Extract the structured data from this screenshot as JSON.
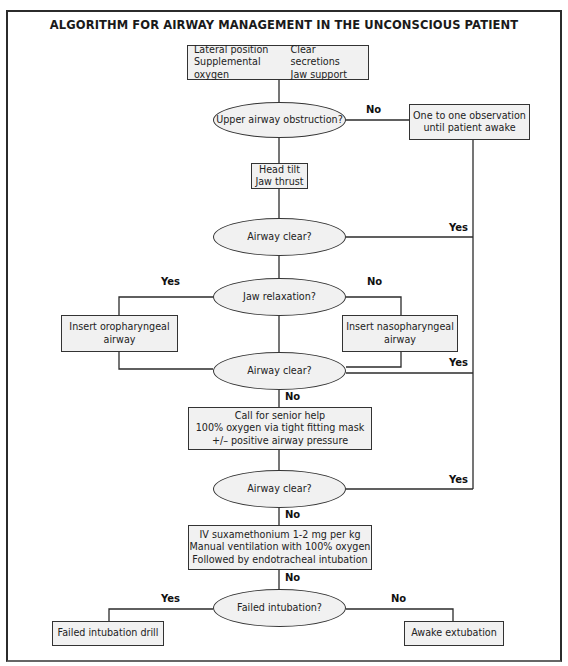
{
  "title": "ALGORITHM FOR AIRWAY MANAGEMENT IN THE UNCONSCIOUS PATIENT",
  "nodes": {
    "initial": {
      "col1": [
        "Lateral position",
        "Supplemental oxygen"
      ],
      "col2": [
        "Clear secretions",
        "Jaw support"
      ]
    },
    "upper_airway_obstruction": "Upper airway obstruction?",
    "observation": [
      "One to one observation",
      "until patient awake"
    ],
    "head_tilt": [
      "Head tilt",
      "Jaw thrust"
    ],
    "airway_clear_1": "Airway clear?",
    "jaw_relaxation": "Jaw relaxation?",
    "oropharyngeal": [
      "Insert oropharyngeal",
      "airway"
    ],
    "nasopharyngeal": [
      "Insert nasopharyngeal",
      "airway"
    ],
    "airway_clear_2": "Airway clear?",
    "senior_help": [
      "Call for senior help",
      "100% oxygen via tight fitting mask",
      "+/– positive airway pressure"
    ],
    "airway_clear_3": "Airway clear?",
    "suxamethonium": [
      "IV suxamethonium 1-2 mg per kg",
      "Manual ventilation with 100% oxygen",
      "Followed by endotracheal intubation"
    ],
    "failed_intubation": "Failed intubation?",
    "failed_drill": "Failed intubation drill",
    "awake_extubation": "Awake extubation"
  },
  "labels": {
    "no_obstruction": "No",
    "yes_clear_1": "Yes",
    "yes_jaw": "Yes",
    "no_jaw": "No",
    "yes_clear_2": "Yes",
    "no_clear_2": "No",
    "yes_clear_3": "Yes",
    "no_clear_3": "No",
    "no_after_sux": "No",
    "yes_failed": "Yes",
    "no_failed": "No"
  },
  "colors": {
    "box_fill": "#f1f1f1",
    "line": "#2b2b2b"
  }
}
